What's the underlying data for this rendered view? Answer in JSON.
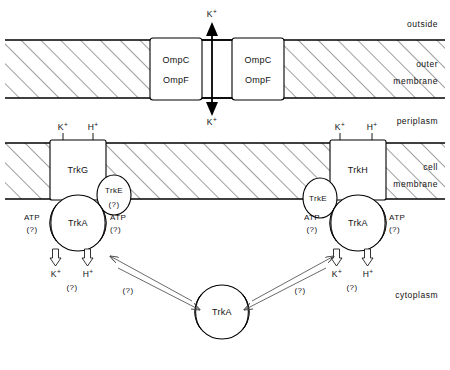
{
  "figure": {
    "type": "biological-schematic"
  },
  "regions": [
    {
      "id": "outside",
      "label": "outside",
      "x": 438,
      "y": 24
    },
    {
      "id": "outer-membrane",
      "label_line1": "outer",
      "label_line2": "membrane",
      "x": 438,
      "y": 65
    },
    {
      "id": "periplasm",
      "label": "periplasm",
      "x": 438,
      "y": 121
    },
    {
      "id": "cell-membrane",
      "label_line1": "cell",
      "label_line2": "membrane",
      "x": 438,
      "y": 168
    },
    {
      "id": "cytoplasm",
      "label": "cytoplasm",
      "x": 438,
      "y": 295
    }
  ],
  "membranes": {
    "outer": {
      "top": 40,
      "bottom": 98
    },
    "cell": {
      "top": 143,
      "bottom": 199
    }
  },
  "porins": [
    {
      "id": "porin-left",
      "line1": "OmpC",
      "line2": "OmpF",
      "x": 150,
      "y": 38,
      "w": 52,
      "h": 62
    },
    {
      "id": "porin-right",
      "line1": "OmpC",
      "line2": "OmpF",
      "x": 232,
      "y": 38,
      "w": 52,
      "h": 62
    }
  ],
  "porin_channel": {
    "ion": "K",
    "charge": "+",
    "top_label_y": 18,
    "bottom_label_y": 120,
    "arrow_x": 212
  },
  "transporters": [
    {
      "id": "trkG",
      "label": "TrkG",
      "x": 50,
      "y": 140,
      "w": 56,
      "h": 60,
      "substrates": [
        {
          "ion": "K",
          "charge": "+",
          "x": 63,
          "y": 130
        },
        {
          "ion": "H",
          "charge": "+",
          "x": 93,
          "y": 130
        }
      ],
      "trkE": {
        "label": "TrkE",
        "unknown": "(?)",
        "cx": 114,
        "cy": 195,
        "rx": 17,
        "ry": 20
      },
      "trkA": {
        "label": "TrkA",
        "cx": 78,
        "cy": 223,
        "r": 28,
        "atp_left": {
          "label": "ATP",
          "unknown": "(?)",
          "x": 32,
          "y": 220
        },
        "atp_right": {
          "label": "ATP",
          "unknown": "(?)",
          "x": 108,
          "y": 220
        }
      },
      "efflux": [
        {
          "ion": "K",
          "charge": "+",
          "x": 56,
          "y": 270
        },
        {
          "ion": "H",
          "charge": "+",
          "x": 88,
          "y": 270
        }
      ],
      "efflux_unknown": {
        "label": "(?)",
        "x": 72,
        "y": 283
      }
    },
    {
      "id": "trkH",
      "label": "TrkH",
      "x": 330,
      "y": 140,
      "w": 56,
      "h": 60,
      "substrates": [
        {
          "ion": "K",
          "charge": "+",
          "x": 337,
          "y": 130
        },
        {
          "ion": "H",
          "charge": "+",
          "x": 370,
          "y": 130
        }
      ],
      "trkE": {
        "label": "TrkE",
        "unknown": "",
        "cx": 320,
        "cy": 198,
        "rx": 17,
        "ry": 20
      },
      "trkA": {
        "label": "TrkA",
        "cx": 358,
        "cy": 223,
        "r": 28,
        "atp_left": {
          "label": "ATP",
          "unknown": "(?)",
          "x": 312,
          "y": 220
        },
        "atp_right": {
          "label": "ATP",
          "unknown": "(?)",
          "x": 388,
          "y": 220
        }
      },
      "efflux": [
        {
          "ion": "K",
          "charge": "+",
          "x": 337,
          "y": 270
        },
        {
          "ion": "H",
          "charge": "+",
          "x": 368,
          "y": 270
        }
      ],
      "efflux_unknown": {
        "label": "(?)",
        "x": 352,
        "y": 283
      }
    }
  ],
  "cytoplasmic_pool": {
    "id": "trkA-pool",
    "label": "TrkA",
    "cx": 222,
    "cy": 312,
    "r": 27
  },
  "exchange_arrows": [
    {
      "id": "left-exchange",
      "unknown": "(?)",
      "label_x": 128,
      "label_y": 290
    },
    {
      "id": "right-exchange",
      "unknown": "(?)",
      "label_x": 300,
      "label_y": 290
    }
  ],
  "colors": {
    "stroke": "#000000",
    "fill": "#ffffff",
    "text": "#111111",
    "thin_arrow": "#444444"
  }
}
